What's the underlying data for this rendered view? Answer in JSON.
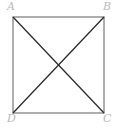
{
  "figure": {
    "background_color": "#ffffff",
    "shape": {
      "name": "square",
      "edge_color": "#8c8c8c",
      "edge_width": 1.4,
      "x_left": 13,
      "x_right": 104,
      "y_top": 17,
      "y_bottom": 113
    },
    "diagonals": {
      "color": "#2b2b2b",
      "width": 1.3,
      "intersection": {
        "x": 58.5,
        "y": 65
      },
      "segments": [
        {
          "name": "diagonal-a-c",
          "from": "A",
          "to": "C"
        },
        {
          "name": "diagonal-b-d",
          "from": "B",
          "to": "D"
        }
      ]
    },
    "labels": {
      "color": "#b9b9b9",
      "style": "italic-serif",
      "a": "A",
      "b": "B",
      "c": "C",
      "d": "D"
    }
  }
}
